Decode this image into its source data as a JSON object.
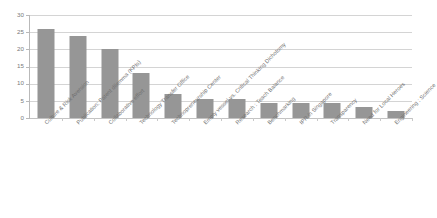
{
  "chart_data": {
    "type": "bar",
    "title": "",
    "subtitle": "",
    "xlabel": "",
    "ylabel": "",
    "ylim": [
      0,
      30
    ],
    "y_ticks": [
      0,
      5,
      10,
      15,
      20,
      25,
      30
    ],
    "grid": true,
    "legend": "none",
    "orientation": "vertical",
    "bar_color": "#969696",
    "gridline_color": "#d4d4d4",
    "axis_color": "#b9b9b9",
    "tick_label_color": "#7a7a7a",
    "category_label_rotation": -45,
    "categories": [
      "Culture & Risk Aversion",
      "Publication: Patent dilemma (KPIs)",
      "Collaborative effort",
      "Technology Transfer Office",
      "Technopreneurship Center",
      "Empty vessel vs. Critical Thinking Dichotomy",
      "Research : Teach Balance",
      "Benchmarking",
      "IPR in Singapore",
      "Transparency",
      "Need for Local Heroes",
      "Engineering : Science"
    ],
    "values": [
      26,
      24,
      20,
      13,
      7,
      5.6,
      5.6,
      4.5,
      4.3,
      4.3,
      3.2,
      2.1
    ]
  }
}
